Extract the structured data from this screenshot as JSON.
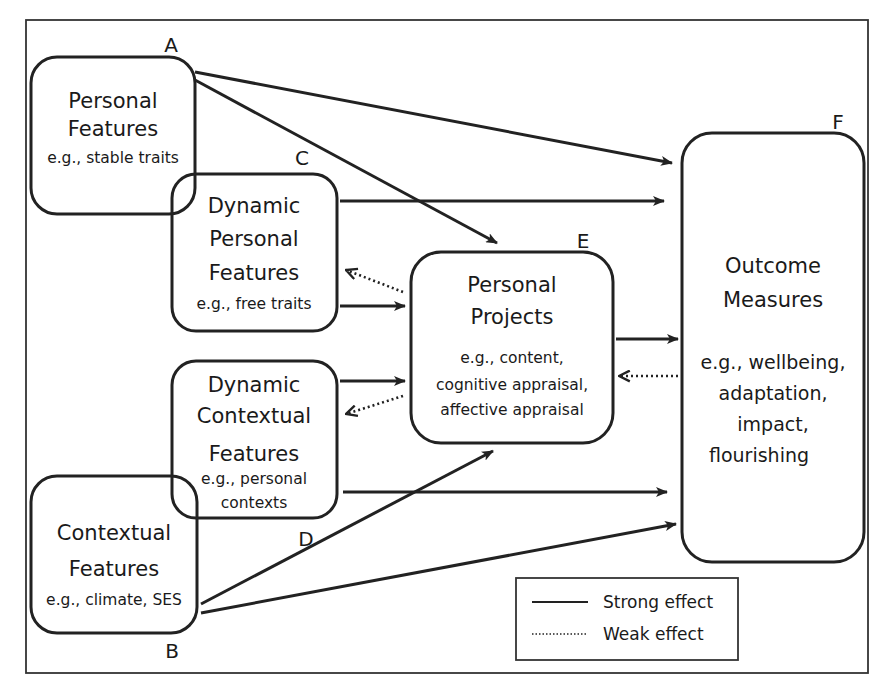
{
  "diagram": {
    "nodes": {
      "A": {
        "letter": "A",
        "title_lines": [
          "Personal",
          "Features"
        ],
        "example_lines": [
          "e.g., stable traits"
        ]
      },
      "B": {
        "letter": "B",
        "title_lines": [
          "Contextual",
          "Features"
        ],
        "example_lines": [
          "e.g., climate, SES"
        ]
      },
      "C": {
        "letter": "C",
        "title_lines": [
          "Dynamic",
          "Personal",
          "Features"
        ],
        "example_lines": [
          "e.g., free traits"
        ]
      },
      "D": {
        "letter": "D",
        "title_lines": [
          "Dynamic",
          "Contextual",
          "Features"
        ],
        "example_lines": [
          "e.g., personal",
          "contexts"
        ]
      },
      "E": {
        "letter": "E",
        "title_lines": [
          "Personal",
          "Projects"
        ],
        "example_lines": [
          "e.g., content,",
          "cognitive appraisal,",
          "affective appraisal"
        ]
      },
      "F": {
        "letter": "F",
        "title_lines": [
          "Outcome",
          "Measures"
        ],
        "example_lines": [
          "e.g., wellbeing,",
          "adaptation,",
          "impact,",
          "flourishing"
        ]
      }
    },
    "edges": [
      {
        "from": "A",
        "to": "F",
        "type": "strong"
      },
      {
        "from": "A",
        "to": "E",
        "type": "strong"
      },
      {
        "from": "C",
        "to": "F",
        "type": "strong"
      },
      {
        "from": "C",
        "to": "E",
        "type": "strong"
      },
      {
        "from": "E",
        "to": "C",
        "type": "weak"
      },
      {
        "from": "D",
        "to": "E",
        "type": "strong"
      },
      {
        "from": "E",
        "to": "D",
        "type": "weak"
      },
      {
        "from": "D",
        "to": "F",
        "type": "strong"
      },
      {
        "from": "E",
        "to": "F",
        "type": "strong"
      },
      {
        "from": "F",
        "to": "E",
        "type": "weak"
      },
      {
        "from": "B",
        "to": "E",
        "type": "strong"
      },
      {
        "from": "B",
        "to": "F",
        "type": "strong"
      }
    ],
    "legend": {
      "strong_label": "Strong effect",
      "weak_label": "Weak effect"
    }
  }
}
